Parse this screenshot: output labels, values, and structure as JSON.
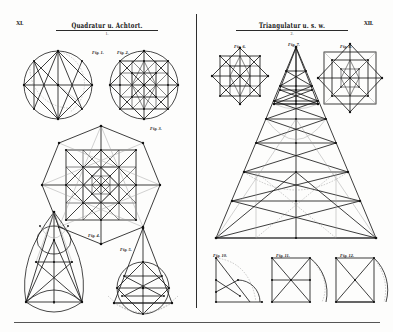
{
  "plate": {
    "background_color": "#fdfdfc",
    "ink_color": "#1b1b1b",
    "faint_ink_color": "#9a9a9a",
    "corner_left": "XI.",
    "corner_right": "XII.",
    "bottom_rule": true,
    "gutter_divider": true
  },
  "left_page": {
    "title": "Quadratur u. Achtort.",
    "subtitle": "1.",
    "figures": [
      {
        "id": "fig1",
        "label": "Fig. 1.",
        "description": "circle with inscribed square, diagonals and construction arc"
      },
      {
        "id": "fig2",
        "label": "Fig. 2.",
        "description": "circle with nested square lattice and octagram"
      },
      {
        "id": "fig3",
        "label": "Fig. 3.",
        "description": "large heptagon / octagon with nested square grid"
      },
      {
        "id": "fig4",
        "label": "Fig. 4.",
        "description": "gothic pointed arch vesica construction"
      },
      {
        "id": "fig5",
        "label": "Fig. 5.",
        "description": "triangle over circle with horizontal chords"
      }
    ]
  },
  "right_page": {
    "title": "Triangulatur u. s. w.",
    "subtitle": "2.",
    "figures": [
      {
        "id": "fig6",
        "label": "Fig. 6.",
        "description": "diamond with inner square lattice"
      },
      {
        "id": "fig7",
        "label": "Fig. 7.",
        "description": "tall narrow triangle with base construction"
      },
      {
        "id": "fig8",
        "label": "Fig. 8.",
        "description": "square with rotated inner square lattice"
      },
      {
        "id": "fig9",
        "label": "Fig. 9.",
        "description": "large isosceles triangle with stepped zigzag divisions"
      },
      {
        "id": "fig10",
        "label": "Fig. 10.",
        "description": "rectangle with quadrant arc and diagonal"
      },
      {
        "id": "fig11",
        "label": "Fig. 11.",
        "description": "rectangle with diagonal, midline and quadrant arc"
      },
      {
        "id": "fig12",
        "label": "Fig. 12.",
        "description": "rectangle with crossed diagonals and quadrant arc"
      }
    ]
  },
  "point_marks": {
    "symbol": "node",
    "color": "#111111"
  },
  "annotations": {
    "a": "a",
    "b": "b",
    "c": "c",
    "d": "d",
    "e": "e",
    "f": "f"
  }
}
